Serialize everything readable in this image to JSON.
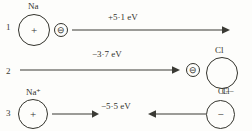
{
  "diagram": {
    "background_color": "#fdfdfb",
    "ink_color": "#33332c",
    "rows": [
      {
        "number": "1",
        "left_species_label": "Na",
        "left_species_charge": "+",
        "electron_charge": "⊖",
        "energy_label": "+5·1 eV",
        "arrow_direction": "right"
      },
      {
        "number": "2",
        "energy_label": "−3·7 eV",
        "electron_charge": "⊖",
        "right_species_label_top": "Cl",
        "right_species_label_bottom": "Cl−",
        "arrow_direction": "right"
      },
      {
        "number": "3",
        "left_species_label": "Na⁺",
        "left_species_charge": "+",
        "energy_label": "−5·5 eV",
        "right_species_label": "Cl−",
        "right_species_charge": "−",
        "arrow_direction": "left"
      }
    ]
  }
}
